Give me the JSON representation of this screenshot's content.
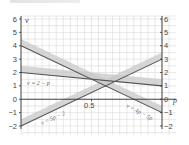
{
  "chart_data": {
    "type": "line",
    "title": "",
    "xlabel": "p",
    "ylabel": "v",
    "xlim": [
      0,
      1
    ],
    "ylim": [
      -2,
      6
    ],
    "x_ticks": [
      {
        "value": 0.5,
        "label": "0.5"
      }
    ],
    "y_ticks_left": [
      "6",
      "5",
      "4",
      "3",
      "2",
      "1",
      "0",
      "-1",
      "-2"
    ],
    "y_ticks_right": [
      "6",
      "5",
      "4",
      "3",
      "2",
      "1",
      "0",
      "-1",
      "-2"
    ],
    "grid": true,
    "series": [
      {
        "name": "v = 2 − p",
        "label": "v = 2 − p",
        "x": [
          0,
          1
        ],
        "values": [
          2,
          1
        ],
        "band_offset": 0.5
      },
      {
        "name": "v = 4 − 5p",
        "label": "v = 4p − 5p",
        "x": [
          0,
          1
        ],
        "values": [
          4,
          -1
        ],
        "band_offset": 0.5
      },
      {
        "name": "v = 5p − 2",
        "label": "v = 5p − 2",
        "x": [
          0,
          1
        ],
        "values": [
          -2,
          3
        ],
        "band_offset": 0.5
      }
    ],
    "colors": {
      "line": "#555555",
      "band": "#c8c8c8",
      "grid": "#d0d0d0",
      "axis": "#333333"
    }
  },
  "labels": {
    "y_axis": "v",
    "x_axis": "p",
    "right_zero": "0",
    "mid_tick": "0.5",
    "eq1": "v = 2 − p",
    "eq2": "v = 4p − 5p",
    "eq3": "v = 5p − 2"
  }
}
